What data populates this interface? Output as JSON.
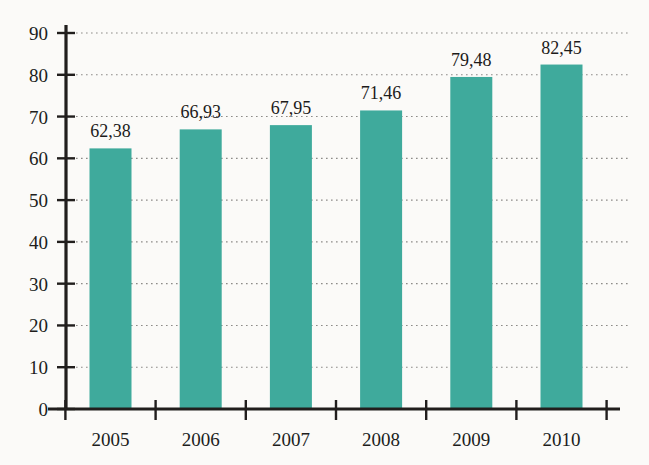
{
  "chart_data": {
    "type": "bar",
    "title": "",
    "subtitle": "",
    "xlabel": "",
    "ylabel": "",
    "categories": [
      "2005",
      "2006",
      "2007",
      "2008",
      "2009",
      "2010"
    ],
    "values": [
      62.38,
      66.93,
      67.95,
      71.46,
      79.48,
      82.45
    ],
    "value_labels": [
      "62,38",
      "66,93",
      "67,95",
      "71,46",
      "79,48",
      "82,45"
    ],
    "series": [
      {
        "name": "",
        "values": [
          62.38,
          66.93,
          67.95,
          71.46,
          79.48,
          82.45
        ]
      }
    ],
    "ylim": [
      0,
      90
    ],
    "ytick_labels": [
      "0",
      "10",
      "20",
      "30",
      "40",
      "50",
      "60",
      "70",
      "80",
      "90"
    ],
    "ytick_values": [
      0,
      10,
      20,
      30,
      40,
      50,
      60,
      70,
      80,
      90
    ],
    "grid": true,
    "grid_style": "dotted-horizontal",
    "legend": false,
    "legend_position": "none",
    "decimal_separator": ",",
    "annotations": [],
    "colors": {
      "bar": "#3faa9c",
      "bar_light": "#4cb3a5",
      "axis": "#211e1d",
      "grid": "#8d8b88",
      "text": "#1d1b1a",
      "background": "#fbfaf8"
    }
  }
}
